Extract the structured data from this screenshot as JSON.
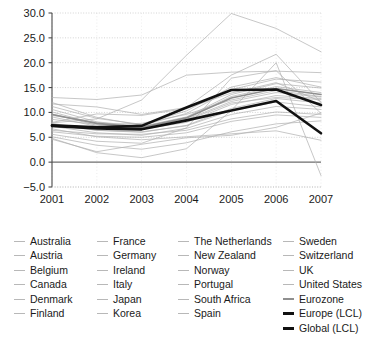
{
  "chart_data": {
    "type": "line",
    "title": "",
    "xlabel": "",
    "ylabel": "",
    "categories": [
      "2001",
      "2002",
      "2003",
      "2004",
      "2005",
      "2006",
      "2007"
    ],
    "x": [
      2001,
      2002,
      2003,
      2004,
      2005,
      2006,
      2007
    ],
    "xlim": [
      2001,
      2007
    ],
    "ylim": [
      -5.0,
      30.0
    ],
    "ytick_labels": [
      "30.0",
      "25.0",
      "20.0",
      "15.0",
      "10.0",
      "5.0",
      "0.0",
      "-5.0"
    ],
    "ytick_values": [
      30.0,
      25.0,
      20.0,
      15.0,
      10.0,
      5.0,
      0.0,
      -5.0
    ],
    "grid": true,
    "legend_position": "below",
    "series": [
      {
        "name": "Australia",
        "style": "thin-gray",
        "values": [
          8.6,
          7.6,
          7.8,
          9.6,
          12.5,
          14.4,
          13.2
        ]
      },
      {
        "name": "Austria",
        "style": "thin-gray",
        "values": [
          9.7,
          7.4,
          6.9,
          8.4,
          11.9,
          13.0,
          12.6
        ]
      },
      {
        "name": "Belgium",
        "style": "thin-gray",
        "values": [
          10.6,
          8.1,
          7.2,
          9.1,
          13.6,
          15.8,
          14.9
        ]
      },
      {
        "name": "Canada",
        "style": "thin-gray",
        "values": [
          11.2,
          8.8,
          7.6,
          10.3,
          15.1,
          17.0,
          15.1
        ]
      },
      {
        "name": "Denmark",
        "style": "thin-gray",
        "values": [
          7.5,
          6.4,
          6.1,
          7.3,
          10.4,
          12.1,
          11.1
        ]
      },
      {
        "name": "Finland",
        "style": "thin-gray",
        "values": [
          6.4,
          5.7,
          5.6,
          6.4,
          8.7,
          10.1,
          9.6
        ]
      },
      {
        "name": "France",
        "style": "thin-gray",
        "values": [
          9.1,
          7.2,
          6.6,
          8.0,
          11.6,
          13.4,
          12.8
        ]
      },
      {
        "name": "Germany",
        "style": "thin-gray",
        "values": [
          12.0,
          9.0,
          7.4,
          9.8,
          14.6,
          16.7,
          16.1
        ]
      },
      {
        "name": "Ireland",
        "style": "thin-gray",
        "values": [
          5.6,
          4.2,
          3.8,
          6.9,
          16.9,
          18.4,
          9.8
        ]
      },
      {
        "name": "Italy",
        "style": "thin-gray",
        "values": [
          9.4,
          8.0,
          7.1,
          8.6,
          12.2,
          14.0,
          13.1
        ]
      },
      {
        "name": "Japan",
        "style": "thin-gray",
        "values": [
          4.6,
          2.1,
          3.6,
          4.9,
          5.4,
          7.0,
          9.9
        ]
      },
      {
        "name": "Korea",
        "style": "thin-gray",
        "values": [
          6.7,
          5.1,
          4.5,
          5.1,
          5.7,
          6.3,
          4.4
        ]
      },
      {
        "name": "The Netherlands",
        "style": "thin-gray",
        "values": [
          10.1,
          7.7,
          6.8,
          9.0,
          13.2,
          15.2,
          14.0
        ]
      },
      {
        "name": "New Zealand",
        "style": "thin-gray",
        "values": [
          8.0,
          9.7,
          9.4,
          10.8,
          13.9,
          16.0,
          12.2
        ]
      },
      {
        "name": "Norway",
        "style": "thin-gray",
        "values": [
          7.2,
          5.9,
          5.4,
          6.8,
          9.6,
          11.2,
          10.6
        ]
      },
      {
        "name": "Portugal",
        "style": "thin-gray",
        "values": [
          13.0,
          12.6,
          13.5,
          17.5,
          18.1,
          18.3,
          18.0
        ]
      },
      {
        "name": "South Africa",
        "style": "thin-gray",
        "values": [
          4.8,
          1.9,
          0.9,
          2.7,
          10.4,
          20.0,
          -2.7
        ]
      },
      {
        "name": "Spain",
        "style": "thin-gray",
        "values": [
          7.9,
          8.7,
          12.5,
          21.5,
          29.9,
          26.9,
          22.2
        ]
      },
      {
        "name": "Sweden",
        "style": "thin-gray",
        "values": [
          7.8,
          6.4,
          6.0,
          7.4,
          10.8,
          12.8,
          11.9
        ]
      },
      {
        "name": "Switzerland",
        "style": "thin-gray",
        "values": [
          6.1,
          5.2,
          5.0,
          5.9,
          8.2,
          9.5,
          9.0
        ]
      },
      {
        "name": "UK",
        "style": "thin-gray",
        "values": [
          11.7,
          11.1,
          9.6,
          11.0,
          17.5,
          21.7,
          12.0
        ]
      },
      {
        "name": "United States",
        "style": "thin-gray",
        "values": [
          5.1,
          3.4,
          2.6,
          3.9,
          6.1,
          7.7,
          8.3
        ]
      },
      {
        "name": "Eurozone",
        "style": "mid-gray",
        "values": [
          9.6,
          7.8,
          7.0,
          8.9,
          12.9,
          14.8,
          13.6
        ]
      },
      {
        "name": "Europe (LCL)",
        "style": "bold-black",
        "values": [
          7.4,
          7.0,
          7.3,
          11.0,
          14.5,
          14.6,
          11.5
        ]
      },
      {
        "name": "Global (LCL)",
        "style": "bold-black",
        "values": [
          7.3,
          6.8,
          6.6,
          8.4,
          10.4,
          12.3,
          5.8
        ]
      }
    ]
  },
  "legend": {
    "columns": [
      {
        "items": [
          {
            "label": "Australia",
            "marker": "thin"
          },
          {
            "label": "Austria",
            "marker": "thin"
          },
          {
            "label": "Belgium",
            "marker": "thin"
          },
          {
            "label": "Canada",
            "marker": "thin"
          },
          {
            "label": "Denmark",
            "marker": "thin"
          },
          {
            "label": "Finland",
            "marker": "thin"
          }
        ]
      },
      {
        "items": [
          {
            "label": "France",
            "marker": "thin"
          },
          {
            "label": "Germany",
            "marker": "thin"
          },
          {
            "label": "Ireland",
            "marker": "thin"
          },
          {
            "label": "Italy",
            "marker": "thin"
          },
          {
            "label": "Japan",
            "marker": "thin"
          },
          {
            "label": "Korea",
            "marker": "thin"
          }
        ]
      },
      {
        "items": [
          {
            "label": "The Netherlands",
            "marker": "thin"
          },
          {
            "label": "New Zealand",
            "marker": "thin"
          },
          {
            "label": "Norway",
            "marker": "thin"
          },
          {
            "label": "Portugal",
            "marker": "thin"
          },
          {
            "label": "South Africa",
            "marker": "thin"
          },
          {
            "label": "Spain",
            "marker": "thin"
          }
        ]
      },
      {
        "items": [
          {
            "label": "Sweden",
            "marker": "thin"
          },
          {
            "label": "Switzerland",
            "marker": "thin"
          },
          {
            "label": "UK",
            "marker": "thin"
          },
          {
            "label": "United States",
            "marker": "thin"
          },
          {
            "label": "Eurozone",
            "marker": "mid"
          },
          {
            "label": "Europe (LCL)",
            "marker": "bold"
          },
          {
            "label": "Global (LCL)",
            "marker": "bold"
          }
        ]
      }
    ]
  },
  "colors": {
    "thin_line": "#b0b0b0",
    "mid_line": "#8f8f8f",
    "bold_line": "#111111",
    "grid": "#c9c9c9",
    "axis": "#4a4a4a",
    "zero_line": "#6e6e6e",
    "text": "#1a1a1a",
    "background": "#ffffff"
  }
}
